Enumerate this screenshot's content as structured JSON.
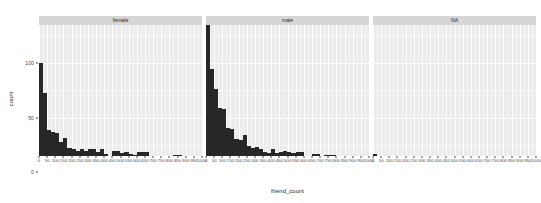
{
  "plot": {
    "type": "ggplot2-faceted-histogram",
    "xlabel": "friend_count",
    "ylabel": "count",
    "theme": {
      "panel_background": "#ebebeb",
      "grid_major": "#ffffff",
      "grid_minor": "#f5f5f5",
      "strip_background": "#d6d6d6",
      "bar_fill": "#272727",
      "text_color": "#2b2b2b",
      "axis_text_color": "#4d4d4d",
      "page_background": "#ffffff"
    }
  },
  "chart_data": {
    "type": "bar",
    "title": "",
    "xlabel": "friend_count",
    "ylabel": "count",
    "xlim": [
      0,
      1000
    ],
    "ylim": [
      0,
      135
    ],
    "binwidth": 25,
    "grid": true,
    "legend": "none",
    "facet_variable": "gender",
    "y_ticks": [
      0,
      50,
      100
    ],
    "x_ticks": [
      0,
      50,
      100,
      150,
      200,
      250,
      300,
      350,
      400,
      450,
      500,
      550,
      600,
      650,
      700,
      750,
      800,
      850,
      900,
      950,
      1000
    ],
    "x_tick_labels": [
      "0",
      "50",
      "100",
      "150",
      "200",
      "250",
      "300",
      "350",
      "400",
      "450",
      "500",
      "550",
      "600",
      "650",
      "700",
      "750",
      "800",
      "850",
      "900",
      "950",
      "1000"
    ],
    "y_tick_labels": [
      "0",
      "50",
      "100"
    ],
    "facets": [
      {
        "label": "female",
        "bin_centers": [
          12,
          37,
          62,
          87,
          112,
          137,
          162,
          187,
          212,
          237,
          262,
          287,
          312,
          337,
          362,
          387,
          412,
          437,
          462,
          487,
          512,
          537,
          562,
          587,
          612,
          637,
          662,
          687,
          712,
          737,
          762,
          787,
          812,
          837,
          862,
          887,
          912,
          937,
          962,
          987
        ],
        "values": [
          85,
          58,
          24,
          22,
          21,
          13,
          17,
          7,
          6,
          5,
          6,
          5,
          6,
          6,
          4,
          6,
          2,
          0,
          5,
          5,
          3,
          4,
          2,
          1,
          4,
          4,
          4,
          0,
          0,
          0,
          0,
          0,
          0,
          1,
          1,
          0,
          0,
          0,
          0,
          0
        ]
      },
      {
        "label": "male",
        "bin_centers": [
          12,
          37,
          62,
          87,
          112,
          137,
          162,
          187,
          212,
          237,
          262,
          287,
          312,
          337,
          362,
          387,
          412,
          437,
          462,
          487,
          512,
          537,
          562,
          587,
          612,
          637,
          662,
          687,
          712,
          737,
          762,
          787,
          812,
          837,
          862,
          887,
          912,
          937,
          962,
          987
        ],
        "values": [
          131,
          80,
          62,
          44,
          43,
          26,
          25,
          16,
          15,
          19,
          9,
          7,
          8,
          6,
          4,
          3,
          6,
          3,
          4,
          5,
          4,
          3,
          4,
          4,
          0,
          0,
          2,
          2,
          0,
          1,
          1,
          1,
          0,
          0,
          0,
          0,
          0,
          0,
          0,
          0
        ]
      },
      {
        "label": "NA",
        "bin_centers": [
          12,
          37,
          62,
          87,
          112,
          137,
          162,
          187,
          212,
          237,
          262,
          287,
          312,
          337,
          362,
          387,
          412,
          437,
          462,
          487,
          512,
          537,
          562,
          587,
          612,
          637,
          662,
          687,
          712,
          737,
          762,
          787,
          812,
          837,
          862,
          887,
          912,
          937,
          962,
          987
        ],
        "values": [
          2,
          0,
          0,
          0,
          0,
          0,
          0,
          0,
          0,
          0,
          0,
          0,
          0,
          0,
          0,
          0,
          0,
          0,
          0,
          0,
          0,
          0,
          0,
          0,
          0,
          0,
          0,
          0,
          0,
          0,
          0,
          0,
          0,
          0,
          0,
          0,
          0,
          0,
          0,
          0
        ]
      }
    ]
  }
}
